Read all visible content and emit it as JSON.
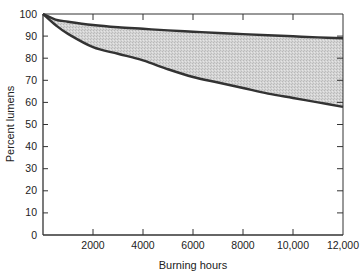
{
  "chart_data": {
    "type": "area",
    "title": "",
    "xlabel": "Burning hours",
    "ylabel": "Percent lumens",
    "xlim": [
      0,
      12000
    ],
    "ylim": [
      0,
      100
    ],
    "grid": false,
    "legend": null,
    "x_ticks": [
      0,
      2000,
      4000,
      6000,
      8000,
      10000,
      12000
    ],
    "x_tick_labels": [
      "",
      "2000",
      "4000",
      "6000",
      "8000",
      "10,000",
      "12,000"
    ],
    "y_ticks": [
      0,
      10,
      20,
      30,
      40,
      50,
      60,
      70,
      80,
      90,
      100
    ],
    "y_tick_labels": [
      "0",
      "10",
      "20",
      "30",
      "40",
      "50",
      "60",
      "70",
      "80",
      "90",
      "100"
    ],
    "x": [
      0,
      500,
      1000,
      2000,
      3000,
      4000,
      5000,
      6000,
      7000,
      8000,
      9000,
      10000,
      11000,
      12000
    ],
    "series": [
      {
        "name": "Upper bound",
        "values": [
          100,
          97.5,
          96.5,
          95,
          94,
          93.3,
          92.6,
          92,
          91.4,
          90.9,
          90.4,
          89.9,
          89.4,
          89
        ]
      },
      {
        "name": "Lower bound",
        "values": [
          100,
          95,
          91,
          85,
          82,
          79,
          75,
          71.5,
          69,
          66.5,
          64,
          62,
          60,
          58
        ]
      }
    ],
    "fill_between": {
      "color": "#cfcfcf",
      "pattern": "stipple"
    },
    "colors": {
      "line": "#333333",
      "fill": "#cfcfcf",
      "axis": "#333333"
    }
  }
}
